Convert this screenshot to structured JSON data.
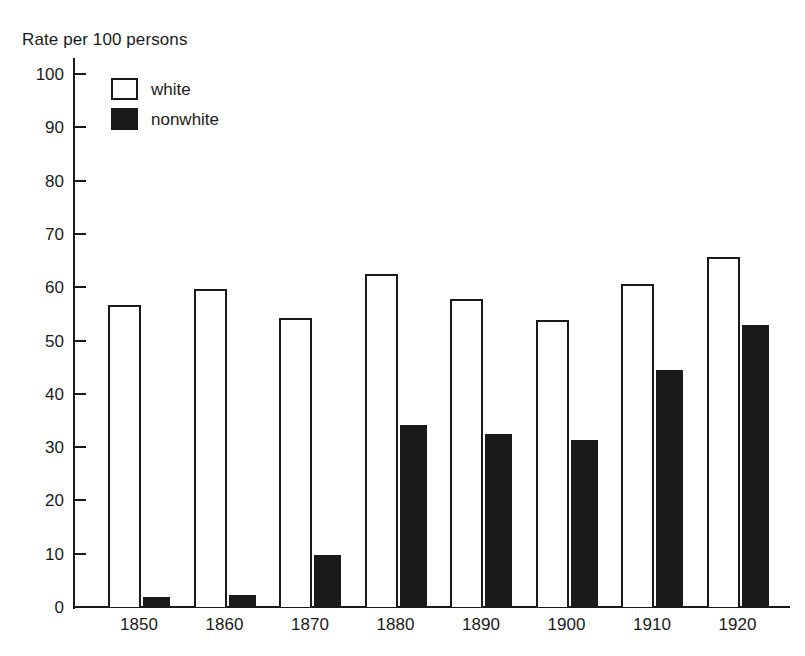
{
  "chart_data": {
    "type": "bar",
    "title": "Rate per 100 persons",
    "xlabel": "",
    "ylabel": "Rate per 100 persons",
    "ylim": [
      0,
      100
    ],
    "yticks": [
      0,
      10,
      20,
      30,
      40,
      50,
      60,
      70,
      80,
      90,
      100
    ],
    "grid": false,
    "legend_position": "top-left",
    "categories": [
      "1850",
      "1860",
      "1870",
      "1880",
      "1890",
      "1900",
      "1910",
      "1920"
    ],
    "series": [
      {
        "name": "white",
        "color": "#ffffff",
        "edge_color": "#1a1a1a",
        "values": [
          56.6,
          59.7,
          54.2,
          62.5,
          57.8,
          53.8,
          60.6,
          65.7
        ]
      },
      {
        "name": "nonwhite",
        "color": "#1a1a1a",
        "edge_color": "#1a1a1a",
        "values": [
          1.9,
          2.3,
          9.8,
          34.2,
          32.4,
          31.3,
          44.4,
          53.0
        ]
      }
    ]
  },
  "axis": {
    "title": "Rate per 100 persons",
    "y_tick_labels": [
      "100",
      "90",
      "80",
      "70",
      "60",
      "50",
      "40",
      "30",
      "20",
      "10",
      "0"
    ],
    "x_tick_labels": [
      "1850",
      "1860",
      "1870",
      "1880",
      "1890",
      "1900",
      "1910",
      "1920"
    ]
  },
  "legend": {
    "items": [
      {
        "label": "white",
        "swatch": "hollow-square"
      },
      {
        "label": "nonwhite",
        "swatch": "filled-square"
      }
    ]
  }
}
